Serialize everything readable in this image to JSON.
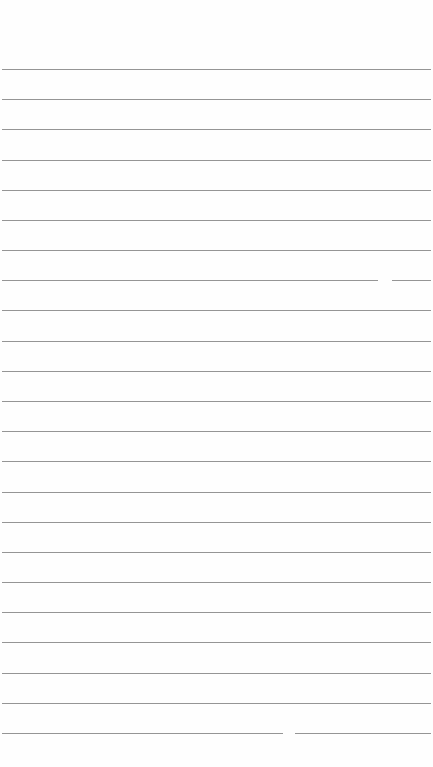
{
  "page": {
    "type": "lined-paper",
    "background_color": "#fefefe",
    "line_color": "#8a8a8a",
    "line_count": 23,
    "first_line_y": 69,
    "line_spacing": 30.18,
    "line_left": 2,
    "line_right": 431,
    "gaps": [
      {
        "line_index": 7,
        "x": 378,
        "width": 14
      },
      {
        "line_index": 22,
        "x": 283,
        "width": 12
      }
    ]
  }
}
